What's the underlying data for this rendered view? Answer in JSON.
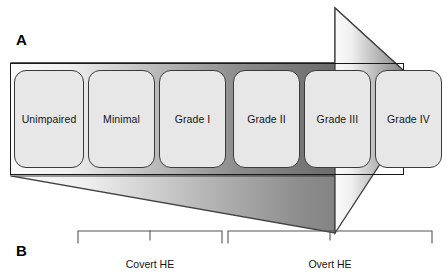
{
  "figure": {
    "width": 448,
    "height": 278,
    "background": "#ffffff"
  },
  "panels": [
    {
      "id": "A",
      "letter": "A"
    },
    {
      "id": "B",
      "letter": "B"
    }
  ],
  "spectrum": {
    "band_border_color": "#1a1a1a",
    "box_fill_color": "#e7e7e7",
    "box_border_color": "#3a3a3a",
    "stages": [
      {
        "label": "Unimpaired",
        "x": 0,
        "width": 70,
        "group": "covert"
      },
      {
        "label": "Minimal",
        "x": 74,
        "width": 67,
        "group": "covert"
      },
      {
        "label": "Grade I",
        "x": 145,
        "width": 67,
        "group": "covert"
      },
      {
        "label": "Grade II",
        "x": 219,
        "width": 67,
        "group": "overt"
      },
      {
        "label": "Grade III",
        "x": 290,
        "width": 67,
        "group": "overt"
      },
      {
        "label": "Grade IV",
        "x": 361,
        "width": 67,
        "group": "overt"
      }
    ]
  },
  "arrow": {
    "name": "severity-progression-arrow",
    "direction": "right",
    "gradient_start_color": "#f2f2f2",
    "gradient_end_color": "#6e6e6e",
    "outline_color": "#3f3f3f"
  },
  "brackets": [
    {
      "id": "covert",
      "caption": "Covert HE",
      "left": 78,
      "right": 222,
      "tick_x": 150
    },
    {
      "id": "overt",
      "caption": "Overt HE",
      "left": 228,
      "right": 432,
      "tick_x": 330
    }
  ]
}
